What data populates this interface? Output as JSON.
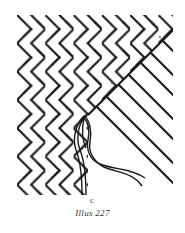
{
  "figure": {
    "stroke_color": "#1a1a1a",
    "background": "#ffffff",
    "annotations": [
      {
        "id": "mark-a",
        "text": "·",
        "x": 160,
        "y": 37
      },
      {
        "id": "mark-b",
        "text": "·",
        "x": 112,
        "y": 83
      },
      {
        "id": "mark-c",
        "text": "·",
        "x": 130,
        "y": 172
      }
    ]
  },
  "labels": {
    "point_label": "C",
    "caption": "Illus 227"
  }
}
